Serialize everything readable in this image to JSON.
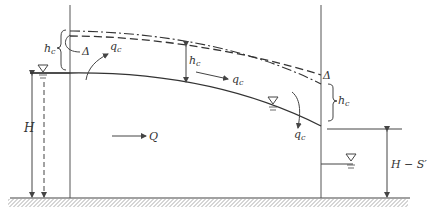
{
  "diagram": {
    "colors": {
      "line": "#444444",
      "background": "#ffffff"
    },
    "labels": {
      "hc_left": "h",
      "hc_left_sub": "c",
      "delta_left": "Δ",
      "qc_top_left": "q",
      "qc_top_left_sub": "c",
      "hc_middle": "h",
      "hc_middle_sub": "c",
      "qc_middle": "q",
      "qc_middle_sub": "c",
      "delta_right": "Δ",
      "hc_right": "h",
      "hc_right_sub": "c",
      "qc_right": "q",
      "qc_right_sub": "c",
      "H": "H",
      "Q": "Q",
      "H_minus_S": "H − S′"
    }
  }
}
